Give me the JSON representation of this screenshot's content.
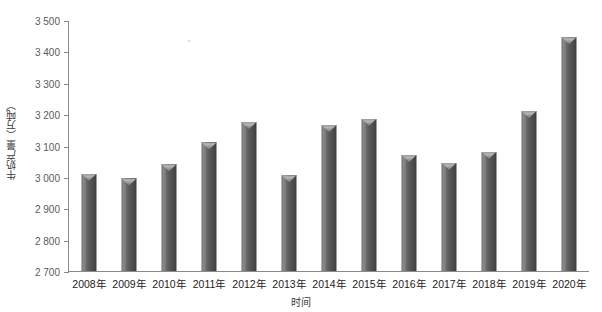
{
  "chart_data": {
    "type": "bar",
    "title": "",
    "subtitle": "",
    "xlabel": "时间",
    "ylabel": "牛奶产量（万吨）",
    "categories": [
      "2008年",
      "2009年",
      "2010年",
      "2011年",
      "2012年",
      "2013年",
      "2014年",
      "2015年",
      "2016年",
      "2017年",
      "2018年",
      "2019年",
      "2020年"
    ],
    "values": [
      3010,
      2995,
      3040,
      3110,
      3175,
      3005,
      3165,
      3185,
      3070,
      3045,
      3080,
      3210,
      3445
    ],
    "ylim": [
      2700,
      3500
    ],
    "ytick_values": [
      2700,
      2800,
      2900,
      3000,
      3100,
      3200,
      3300,
      3400,
      3500
    ],
    "ytick_labels": [
      "2 700",
      "2 800",
      "2 900",
      "3 000",
      "3 100",
      "3 200",
      "3 300",
      "3 400",
      "3 500"
    ],
    "grid": false,
    "legend": null,
    "legend_position": "none",
    "bar_color": "#5a5a5a",
    "axis_color": "#8a8a8a",
    "background_color": "#ffffff"
  }
}
